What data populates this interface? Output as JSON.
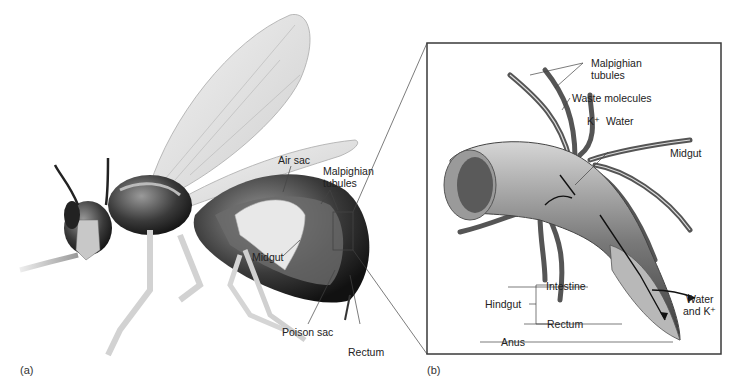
{
  "panel_a": {
    "tag": "(a)",
    "labels": {
      "air_sac": "Air sac",
      "malpighian_1": "Malpighian",
      "malpighian_2": "tubules",
      "midgut": "Midgut",
      "poison_sac": "Poison sac",
      "rectum": "Rectum"
    }
  },
  "panel_b": {
    "tag": "(b)",
    "labels": {
      "malpighian_1": "Malpighian",
      "malpighian_2": "tubules",
      "waste": "Waste molecules",
      "k_ion": "K⁺",
      "water": "Water",
      "midgut": "Midgut",
      "hindgut": "Hindgut",
      "intestine": "Intestine",
      "rectum": "Rectum",
      "anus": "Anus",
      "water_k_1": "Water",
      "water_k_2": "and K⁺"
    }
  },
  "colors": {
    "line": "#333333",
    "box": "#3a3a3a",
    "body_dark": "#1e1e1e",
    "body_mid": "#8a8a8a",
    "body_light": "#d8d8d8",
    "wing": "#e6e6e6"
  }
}
